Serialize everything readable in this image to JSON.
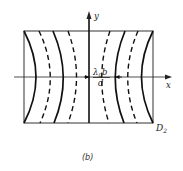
{
  "figure": {
    "caption": "(b)",
    "axis_x_label": "x",
    "axis_y_label": "y",
    "plane_label_main": "D",
    "plane_label_sub": "2",
    "spacing_label": {
      "numerator_main": "λ",
      "numerator_sub": "0",
      "numerator_tail": "b",
      "denominator": "d"
    },
    "fringes": {
      "description": "Interference fringes on screen D2, alternating solid (bright) and dashed (dark) hyperbolic-like curves, symmetric about the y-axis",
      "left": [
        "solid",
        "dashed",
        "solid",
        "dashed"
      ],
      "center": "solid",
      "right": [
        "dashed",
        "solid",
        "dashed",
        "solid"
      ]
    },
    "colors": {
      "line": "#111111",
      "frame": "#333333",
      "background": "#ffffff"
    }
  }
}
